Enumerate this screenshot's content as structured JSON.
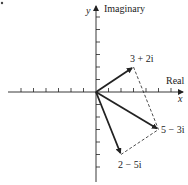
{
  "diagram": {
    "type": "complex-plane-vector-addition",
    "axes": {
      "x_label": "x",
      "x_axis_name": "Real",
      "y_label": "y",
      "y_axis_name": "Imaginary",
      "tick_count_each_side": 6,
      "origin": [
        96,
        92
      ],
      "unit_px": 12.5
    },
    "vectors": [
      {
        "label": "3 + 2i",
        "re": 3,
        "im": 2
      },
      {
        "label": "5 − 3i",
        "re": 5,
        "im": -3
      },
      {
        "label": "2 − 5i",
        "re": 2,
        "im": -5
      }
    ],
    "note": "5 − 3i is the sum of 3 + 2i and 2 − 5i (parallelogram rule, dashed lines)",
    "colors": {
      "ink": "#222222",
      "background": "#ffffff"
    }
  }
}
